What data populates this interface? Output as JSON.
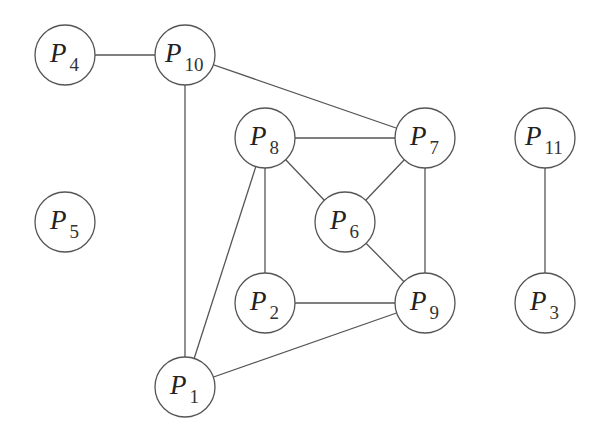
{
  "diagram": {
    "type": "undirected-graph",
    "node_radius": 30,
    "stroke_color": "#555555",
    "background": "#ffffff",
    "nodes": [
      {
        "id": "P1",
        "letter": "P",
        "sub": "1",
        "x": 185,
        "y": 387
      },
      {
        "id": "P2",
        "letter": "P",
        "sub": "2",
        "x": 265,
        "y": 303
      },
      {
        "id": "P3",
        "letter": "P",
        "sub": "3",
        "x": 545,
        "y": 303
      },
      {
        "id": "P4",
        "letter": "P",
        "sub": "4",
        "x": 65,
        "y": 55
      },
      {
        "id": "P5",
        "letter": "P",
        "sub": "5",
        "x": 65,
        "y": 222
      },
      {
        "id": "P6",
        "letter": "P",
        "sub": "6",
        "x": 345,
        "y": 222
      },
      {
        "id": "P7",
        "letter": "P",
        "sub": "7",
        "x": 425,
        "y": 138
      },
      {
        "id": "P8",
        "letter": "P",
        "sub": "8",
        "x": 265,
        "y": 138
      },
      {
        "id": "P9",
        "letter": "P",
        "sub": "9",
        "x": 425,
        "y": 303
      },
      {
        "id": "P10",
        "letter": "P",
        "sub": "10",
        "x": 185,
        "y": 55
      },
      {
        "id": "P11",
        "letter": "P",
        "sub": "11",
        "x": 545,
        "y": 138
      }
    ],
    "edges": [
      [
        "P4",
        "P10"
      ],
      [
        "P10",
        "P7"
      ],
      [
        "P10",
        "P1"
      ],
      [
        "P8",
        "P7"
      ],
      [
        "P8",
        "P6"
      ],
      [
        "P8",
        "P2"
      ],
      [
        "P8",
        "P1"
      ],
      [
        "P7",
        "P6"
      ],
      [
        "P7",
        "P9"
      ],
      [
        "P6",
        "P9"
      ],
      [
        "P2",
        "P9"
      ],
      [
        "P9",
        "P1"
      ],
      [
        "P11",
        "P3"
      ]
    ]
  }
}
